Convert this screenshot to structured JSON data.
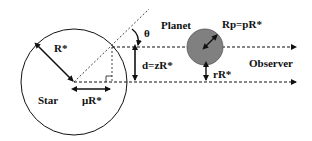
{
  "diagram": {
    "labels": {
      "star": "Star",
      "star_radius": "R*",
      "offset": "μR*",
      "theta": "θ",
      "distance": "d=zR*",
      "planet": "Planet",
      "planet_radius": "Rp=pR*",
      "planet_offset": "rR*",
      "observer": "Observer"
    },
    "colors": {
      "line": "#111111",
      "planet_fill": "#808080",
      "background": "#ffffff"
    }
  }
}
